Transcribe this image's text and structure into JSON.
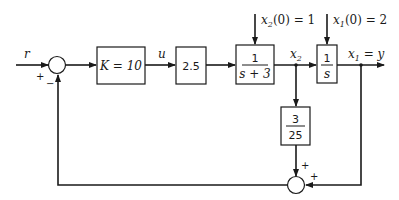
{
  "diagram": {
    "title": "",
    "input_label": "r",
    "sum1": {
      "plus": "+",
      "minus": "−"
    },
    "gain_block": "K = 10",
    "control_label": "u",
    "gain2_block": "2.5",
    "plant1": {
      "num": "1",
      "den": "s + 3"
    },
    "plant2": {
      "num": "1",
      "den": "s"
    },
    "ic2": {
      "var": "x",
      "sub": "2",
      "rest": "(0) = 1"
    },
    "ic1": {
      "var": "x",
      "sub": "1",
      "rest": "(0) = 2"
    },
    "state2_label": {
      "var": "x",
      "sub": "2"
    },
    "output_label": {
      "var": "x",
      "sub": "1",
      "rest": " = y"
    },
    "feedback_block": {
      "num": "3",
      "den": "25"
    },
    "sum2": {
      "plus_top": "+",
      "plus_right": "+"
    }
  }
}
